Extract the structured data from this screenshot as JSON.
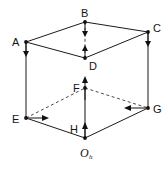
{
  "figure": {
    "background_color": "#ffffff",
    "line_color": "#1b1b1b",
    "hidden_line_color": "#4a4a4a",
    "width": 168,
    "height": 170,
    "vertices": [
      {
        "id": "A",
        "label": "A",
        "x": 26,
        "y": 42,
        "label_x": 12,
        "label_y": 42,
        "hidden": false
      },
      {
        "id": "B",
        "label": "B",
        "x": 85,
        "y": 22,
        "label_x": 81,
        "label_y": 16,
        "hidden": false
      },
      {
        "id": "C",
        "label": "C",
        "x": 148,
        "y": 32,
        "label_x": 153,
        "label_y": 31,
        "hidden": false
      },
      {
        "id": "D",
        "label": "D",
        "x": 85,
        "y": 58,
        "label_x": 89,
        "label_y": 68,
        "hidden": false
      },
      {
        "id": "E",
        "label": "E",
        "x": 26,
        "y": 118,
        "label_x": 12,
        "label_y": 121,
        "hidden": false
      },
      {
        "id": "F",
        "label": "F",
        "x": 85,
        "y": 88,
        "label_x": 74,
        "label_y": 89,
        "hidden": true
      },
      {
        "id": "G",
        "label": "G",
        "x": 148,
        "y": 108,
        "label_x": 153,
        "label_y": 111,
        "hidden": false
      },
      {
        "id": "H",
        "label": "H",
        "x": 85,
        "y": 138,
        "label_x": 72,
        "label_y": 132,
        "hidden": false
      },
      {
        "id": "O_h",
        "label": "O",
        "sublabel": "h",
        "x": 85,
        "y": 138,
        "label_x": 83,
        "label_y": 154,
        "hidden": false
      }
    ],
    "edges": [
      {
        "from": "A",
        "to": "B",
        "style": "solid"
      },
      {
        "from": "B",
        "to": "C",
        "style": "solid"
      },
      {
        "from": "A",
        "to": "D",
        "style": "solid"
      },
      {
        "from": "D",
        "to": "C",
        "style": "solid"
      },
      {
        "from": "A",
        "to": "E",
        "style": "solid"
      },
      {
        "from": "C",
        "to": "G",
        "style": "solid"
      },
      {
        "from": "B",
        "to": "D",
        "style": "dashed"
      },
      {
        "from": "E",
        "to": "F",
        "style": "dashed"
      },
      {
        "from": "F",
        "to": "G",
        "style": "dashed"
      },
      {
        "from": "E",
        "to": "H",
        "style": "solid"
      },
      {
        "from": "H",
        "to": "G",
        "style": "solid"
      },
      {
        "from": "F",
        "to": "H",
        "style": "solid"
      }
    ],
    "arrows": [
      {
        "id": "arrow-A-down",
        "at": "A",
        "direction": "down",
        "style": "solid"
      },
      {
        "id": "arrow-B-down",
        "at": "B",
        "direction": "down",
        "style": "dashed"
      },
      {
        "id": "arrow-C-down",
        "at": "C",
        "direction": "down",
        "style": "solid"
      },
      {
        "id": "arrow-D-up",
        "at": "D",
        "direction": "up",
        "style": "dashed"
      },
      {
        "id": "arrow-E-right",
        "at": "E",
        "direction": "right",
        "style": "solid"
      },
      {
        "id": "arrow-F-up",
        "at": "F",
        "direction": "up",
        "style": "solid"
      },
      {
        "id": "arrow-G-left",
        "at": "G",
        "direction": "left",
        "style": "solid"
      },
      {
        "id": "arrow-H-up",
        "at": "H",
        "direction": "up",
        "style": "solid"
      }
    ]
  }
}
